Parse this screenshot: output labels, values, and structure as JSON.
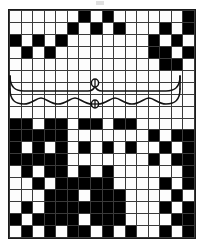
{
  "chart_data": {
    "type": "heatmap",
    "xlabel": "",
    "ylabel": "",
    "columns": 16,
    "rows": 19,
    "legend": [
      {
        "key": "filled",
        "label": "filled square",
        "color": "#000000"
      },
      {
        "key": "empty",
        "label": "open square",
        "color": "#fdfdfd"
      }
    ],
    "grid": true,
    "cell_values": {
      "filled": 1,
      "empty": 0
    },
    "matrix": [
      [
        0,
        0,
        0,
        0,
        0,
        0,
        1,
        0,
        1,
        0,
        0,
        0,
        0,
        0,
        0,
        1
      ],
      [
        0,
        0,
        0,
        0,
        0,
        1,
        0,
        1,
        0,
        1,
        0,
        0,
        0,
        1,
        0,
        1
      ],
      [
        1,
        0,
        1,
        0,
        1,
        0,
        0,
        0,
        0,
        0,
        0,
        0,
        1,
        0,
        1,
        0
      ],
      [
        0,
        1,
        0,
        1,
        0,
        0,
        0,
        0,
        0,
        0,
        0,
        0,
        1,
        1,
        0,
        1
      ],
      [
        0,
        0,
        0,
        0,
        0,
        0,
        0,
        0,
        0,
        0,
        0,
        0,
        0,
        1,
        1,
        0
      ],
      [
        0,
        0,
        0,
        0,
        0,
        0,
        0,
        0,
        0,
        0,
        0,
        0,
        0,
        0,
        0,
        0
      ],
      [
        0,
        0,
        0,
        0,
        0,
        0,
        0,
        0,
        0,
        0,
        0,
        0,
        0,
        0,
        0,
        0
      ],
      [
        0,
        0,
        0,
        0,
        0,
        0,
        0,
        0,
        0,
        0,
        0,
        0,
        0,
        0,
        0,
        0
      ],
      [
        0,
        0,
        0,
        0,
        0,
        0,
        0,
        0,
        0,
        0,
        0,
        0,
        0,
        0,
        0,
        0
      ],
      [
        1,
        1,
        0,
        1,
        1,
        0,
        1,
        1,
        0,
        1,
        1,
        0,
        0,
        0,
        0,
        0
      ],
      [
        1,
        1,
        1,
        1,
        1,
        0,
        0,
        0,
        0,
        0,
        0,
        0,
        1,
        0,
        1,
        1
      ],
      [
        1,
        0,
        1,
        0,
        1,
        0,
        1,
        0,
        1,
        0,
        1,
        0,
        0,
        1,
        0,
        1
      ],
      [
        1,
        1,
        1,
        1,
        1,
        0,
        0,
        0,
        0,
        0,
        0,
        0,
        1,
        0,
        1,
        1
      ],
      [
        0,
        1,
        0,
        1,
        1,
        0,
        1,
        0,
        1,
        0,
        0,
        0,
        0,
        0,
        0,
        1
      ],
      [
        0,
        0,
        1,
        0,
        1,
        1,
        1,
        1,
        1,
        0,
        0,
        0,
        0,
        1,
        0,
        1
      ],
      [
        0,
        0,
        0,
        1,
        1,
        1,
        0,
        1,
        1,
        1,
        0,
        0,
        0,
        0,
        1,
        0
      ],
      [
        0,
        1,
        0,
        1,
        1,
        1,
        1,
        1,
        1,
        1,
        0,
        0,
        0,
        1,
        0,
        1
      ],
      [
        1,
        0,
        1,
        1,
        1,
        1,
        0,
        1,
        1,
        1,
        0,
        0,
        0,
        0,
        1,
        1
      ],
      [
        0,
        1,
        0,
        1,
        0,
        1,
        1,
        0,
        1,
        0,
        1,
        0,
        0,
        1,
        0,
        1
      ]
    ],
    "overlay": {
      "name": "swag-garland-motif",
      "description": "hand-drawn scalloped swag with two small ring beads at center, drawn across the blank band",
      "band_rows": [
        6,
        7
      ],
      "rings": 2,
      "scallops": 6
    }
  },
  "colors": {
    "fill": "#000000",
    "background": "#fdfdfd",
    "gridline": "#3a3a3a",
    "border": "#1a1a1a",
    "ink": "#111111"
  }
}
